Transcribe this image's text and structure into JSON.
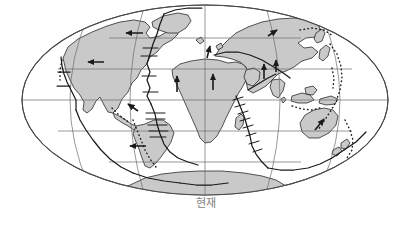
{
  "figure": {
    "caption": "현재",
    "projection": "mollweide-oval",
    "colors": {
      "background": "#ffffff",
      "land_fill": "#c9c9c9",
      "coastline": "#2b2b2b",
      "graticule": "#6b6b6b",
      "plate_boundary": "#1a1a1a",
      "caption_text": "#7d7d7d"
    },
    "geometry": {
      "center_x": 205,
      "center_y": 100,
      "radius_x": 183,
      "radius_y": 95
    }
  },
  "map": {
    "title_alt": "world-map-present-day-plate-tectonics",
    "graticule": {
      "parallels_label": "parallels",
      "parallels_y": [
        40,
        70,
        100,
        130,
        160
      ],
      "meridians_label": "meridians",
      "meridian_offsets": [
        -1,
        -0.666,
        -0.333,
        0,
        0.333,
        0.666,
        1
      ]
    },
    "landmasses": [
      {
        "name": "north-america"
      },
      {
        "name": "greenland"
      },
      {
        "name": "south-america"
      },
      {
        "name": "africa"
      },
      {
        "name": "europe-asia"
      },
      {
        "name": "india"
      },
      {
        "name": "arabia"
      },
      {
        "name": "australia"
      },
      {
        "name": "antarctica"
      },
      {
        "name": "madagascar"
      },
      {
        "name": "japan-arc"
      },
      {
        "name": "indonesia"
      },
      {
        "name": "new-zealand"
      },
      {
        "name": "new-guinea"
      }
    ],
    "plate_boundaries": [
      {
        "name": "mid-atlantic-ridge",
        "type": "divergent"
      },
      {
        "name": "south-atlantic-ridge",
        "type": "divergent"
      },
      {
        "name": "southwest-indian-ridge",
        "type": "divergent"
      },
      {
        "name": "east-pacific-rise",
        "type": "divergent"
      },
      {
        "name": "central-indian-ridge",
        "type": "divergent"
      },
      {
        "name": "andean-trench",
        "type": "convergent-dotted"
      },
      {
        "name": "west-pacific-trench",
        "type": "convergent-dotted"
      },
      {
        "name": "aleutian-trench",
        "type": "convergent-dotted"
      },
      {
        "name": "mediterranean-alpine-belt",
        "type": "convergent"
      }
    ],
    "motion_arrows": [
      {
        "name": "arrow-pacific-nw",
        "direction": "west"
      },
      {
        "name": "arrow-north-america-west",
        "direction": "west"
      },
      {
        "name": "arrow-south-america-west",
        "direction": "northwest"
      },
      {
        "name": "arrow-nazca-east",
        "direction": "west"
      },
      {
        "name": "arrow-africa-north",
        "direction": "north"
      },
      {
        "name": "arrow-west-africa-north",
        "direction": "north"
      },
      {
        "name": "arrow-eurasia-north",
        "direction": "north"
      },
      {
        "name": "arrow-india-north",
        "direction": "north"
      },
      {
        "name": "arrow-australia-north",
        "direction": "northeast"
      },
      {
        "name": "arrow-siberia-ne",
        "direction": "northeast"
      },
      {
        "name": "arrow-europe-north",
        "direction": "north"
      }
    ]
  }
}
